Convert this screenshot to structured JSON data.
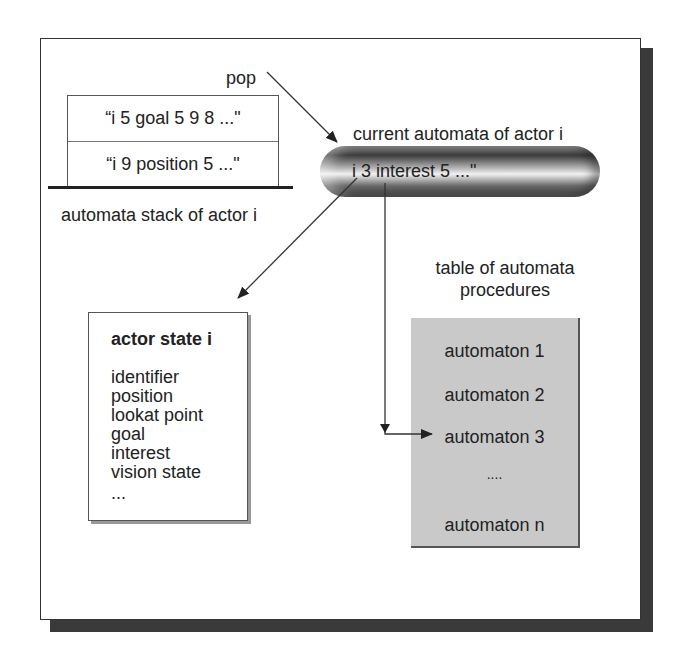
{
  "diagram": {
    "stack": {
      "label": "automata stack of actor i",
      "entries": [
        "“i  5  goal 5 9 8 ...\"",
        "“i  9  position 5 ...\""
      ],
      "pop_label": "pop"
    },
    "current": {
      "label": "current automata of actor i",
      "value": "i  3  interest 5 ...\""
    },
    "actor_state": {
      "title": "actor state i",
      "fields": [
        "identifier",
        "position",
        "lookat point",
        "goal",
        "interest",
        "vision state",
        "..."
      ]
    },
    "table": {
      "label_line1": "table of automata",
      "label_line2": "procedures",
      "items": [
        "automaton 1",
        "automaton 2",
        "automaton 3",
        "....",
        "automaton n"
      ]
    },
    "colors": {
      "frame_shadow": "#3a3a3a",
      "table_fill": "#c9c9c9",
      "line": "#222222"
    }
  }
}
